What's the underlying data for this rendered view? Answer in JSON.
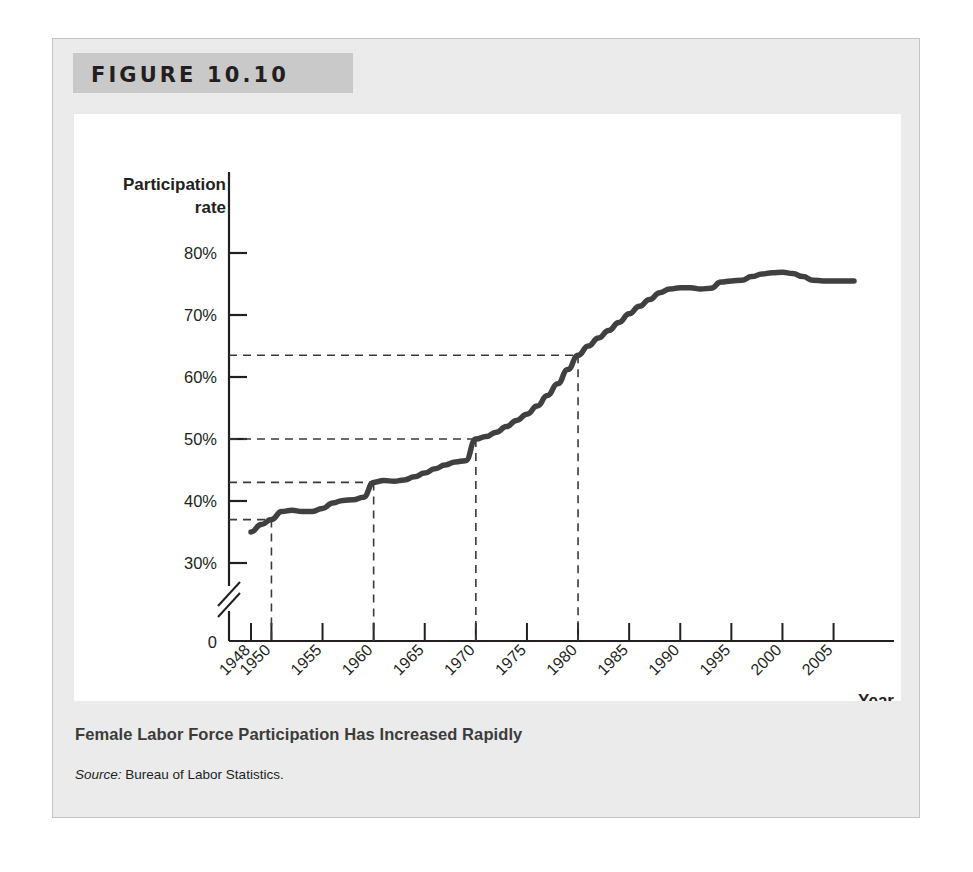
{
  "figure": {
    "number_label": "FIGURE 10.10",
    "caption_title": "Female Labor Force Participation Has Increased Rapidly",
    "source_prefix": "Source:",
    "source_text": "Bureau of Labor Statistics.",
    "banner_color": "#c9c9c9",
    "frame_color": "#ebebeb",
    "panel_color": "#ffffff"
  },
  "chart_data": {
    "type": "line",
    "title": "Female Labor Force Participation Has Increased Rapidly",
    "xlabel": "Year",
    "ylabel": "Participation rate",
    "ylabel_line1": "Participation",
    "ylabel_line2": "rate",
    "xlim": [
      1948,
      2007
    ],
    "ylim": [
      25,
      82
    ],
    "yticks": [
      30,
      40,
      50,
      60,
      70,
      80
    ],
    "ytick_labels": [
      "30%",
      "40%",
      "50%",
      "60%",
      "70%",
      "80%"
    ],
    "y_origin_label": "0",
    "axis_break": true,
    "grid": false,
    "legend": null,
    "line_color": "#404040",
    "xticks": [
      1948,
      1950,
      1955,
      1960,
      1965,
      1970,
      1975,
      1980,
      1985,
      1990,
      1995,
      2000,
      2005
    ],
    "xtick_labels": [
      "1948",
      "1950",
      "1955",
      "1960",
      "1965",
      "1970",
      "1975",
      "1980",
      "1985",
      "1990",
      "1995",
      "2000",
      "2005"
    ],
    "xtick_rotation_deg": 45,
    "series": [
      {
        "name": "Female labor force participation rate",
        "x": [
          1948,
          1949,
          1950,
          1951,
          1952,
          1953,
          1954,
          1955,
          1956,
          1957,
          1958,
          1959,
          1960,
          1961,
          1962,
          1963,
          1964,
          1965,
          1966,
          1967,
          1968,
          1969,
          1970,
          1971,
          1972,
          1973,
          1974,
          1975,
          1976,
          1977,
          1978,
          1979,
          1980,
          1981,
          1982,
          1983,
          1984,
          1985,
          1986,
          1987,
          1988,
          1989,
          1990,
          1991,
          1992,
          1993,
          1994,
          1995,
          1996,
          1997,
          1998,
          1999,
          2000,
          2001,
          2002,
          2003,
          2004,
          2005,
          2006,
          2007
        ],
        "y": [
          35.0,
          35.9,
          37.0,
          38.1,
          38.3,
          38.2,
          38.2,
          38.6,
          39.3,
          39.6,
          39.8,
          40.2,
          40.9,
          41.1,
          41.3,
          41.5,
          41.8,
          42.2,
          42.8,
          43.4,
          43.7,
          43.6,
          43.9,
          44.1,
          44.6,
          45.4,
          46.0,
          46.9,
          47.8,
          48.8,
          50.0,
          51.0,
          51.5,
          52.5,
          52.8,
          53.1,
          53.8,
          54.6,
          55.4,
          56.1,
          57.0,
          57.5,
          57.8,
          57.9,
          57.9,
          57.8,
          58.8,
          59.0,
          59.3,
          59.8,
          59.8,
          60.0,
          59.9,
          59.8,
          59.6,
          59.5,
          59.2,
          59.3,
          59.4,
          59.3
        ],
        "y_plot": [
          35.0,
          36.2,
          37.0,
          38.3,
          38.5,
          38.3,
          38.3,
          38.8,
          39.7,
          40.1,
          40.2,
          40.6,
          43.0,
          43.3,
          43.2,
          43.4,
          43.9,
          44.5,
          45.2,
          45.8,
          46.3,
          46.5,
          50.0,
          50.4,
          51.1,
          52.0,
          53.0,
          54.0,
          55.3,
          57.0,
          58.9,
          61.2,
          63.5,
          65.0,
          66.3,
          67.5,
          68.8,
          70.2,
          71.4,
          72.5,
          73.6,
          74.2,
          74.4,
          74.4,
          74.2,
          74.3,
          75.3,
          75.5,
          75.6,
          76.2,
          76.6,
          76.8,
          76.9,
          76.7,
          76.2,
          75.6,
          75.5,
          75.5,
          75.5,
          75.5
        ]
      }
    ],
    "reference_lines": [
      {
        "year": 1950,
        "rate": 37.0,
        "style": "dashed"
      },
      {
        "year": 1960,
        "rate": 43.0,
        "style": "dashed"
      },
      {
        "year": 1970,
        "rate": 50.0,
        "style": "dashed"
      },
      {
        "year": 1980,
        "rate": 63.5,
        "style": "dashed"
      }
    ]
  }
}
